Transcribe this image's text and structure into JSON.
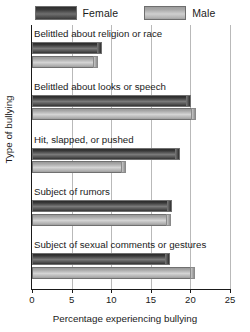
{
  "chart_data": {
    "type": "bar",
    "orientation": "horizontal",
    "title": "",
    "xlabel": "Percentage experiencing bullying",
    "ylabel": "Type of bullying",
    "xlim": [
      0,
      25
    ],
    "xticks": [
      0,
      5,
      10,
      15,
      20,
      25
    ],
    "xtick_labels": [
      "0",
      "5",
      "10",
      "15",
      "20",
      "25"
    ],
    "grid": true,
    "grid_axis": "x",
    "legend_position": "top-center",
    "categories": [
      "Belittled about religion or race",
      "Belittled about looks or speech",
      "Hit, slapped, or pushed",
      "Subject of rumors",
      "Subject of sexual comments or gestures"
    ],
    "series": [
      {
        "name": "Female",
        "color": "#3a3a3a",
        "values": [
          8.7,
          20.0,
          18.6,
          17.5,
          17.3
        ]
      },
      {
        "name": "Male",
        "color": "#b4b4b4",
        "values": [
          8.2,
          20.6,
          11.7,
          17.4,
          20.4
        ]
      }
    ]
  },
  "legend": {
    "entries": [
      {
        "label": "Female",
        "swatch": "female-swatch"
      },
      {
        "label": "Male",
        "swatch": "male-swatch"
      }
    ]
  }
}
